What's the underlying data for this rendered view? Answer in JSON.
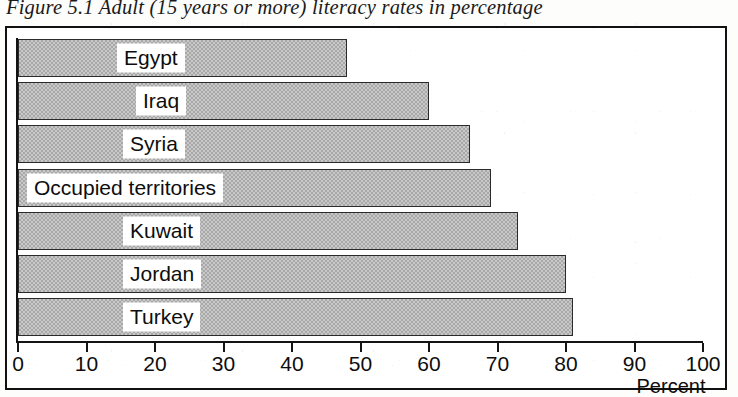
{
  "figure": {
    "caption": "Figure 5.1 Adult (15 years or more) literacy rates in percentage"
  },
  "chart_data": {
    "type": "bar",
    "orientation": "horizontal",
    "title": "Figure 5.1 Adult (15 years or more) literacy rates in percentage",
    "xlabel": "Percent",
    "ylabel": "",
    "categories": [
      "Egypt",
      "Iraq",
      "Syria",
      "Occupied territories",
      "Kuwait",
      "Jordan",
      "Turkey"
    ],
    "values": [
      48,
      60,
      66,
      69,
      73,
      80,
      81
    ],
    "xlim": [
      0,
      100
    ],
    "xticks": [
      0,
      10,
      20,
      30,
      40,
      50,
      60,
      70,
      80,
      90,
      100
    ],
    "xtick_labels": [
      "0",
      "10",
      "20",
      "30",
      "40",
      "50",
      "60",
      "70",
      "80",
      "90",
      "100"
    ],
    "grid": false,
    "legend": false,
    "bar_fill": "#c9c9c9",
    "bar_edge": "#2b2b2b",
    "label_background": "#ffffff",
    "axis_color": "#141414"
  }
}
